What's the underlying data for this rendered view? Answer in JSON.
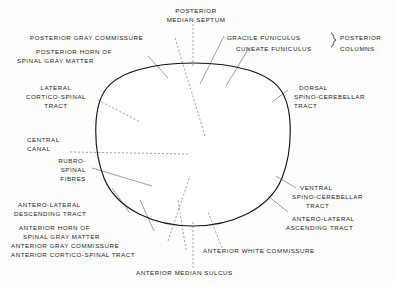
{
  "figure": {
    "background_color": "#fdfdfd",
    "ink_color": "#141414",
    "gray_matter_color": "#9e9e9e",
    "white_matter_color": "#ffffff"
  },
  "labels": {
    "posterior_median_septum": {
      "line1": "POSTERIOR",
      "line2": "MEDIAN SEPTUM"
    },
    "posterior_gray_commissure": {
      "line1": "POSTERIOR GRAY COMMISSURE"
    },
    "posterior_horn": {
      "line1": "POSTERIOR HORN OF",
      "line2": "SPINAL GRAY MATTER"
    },
    "lateral_cortico_spinal": {
      "line1": "LATERAL",
      "line2": "CORTICO-SPINAL",
      "line3": "TRACT"
    },
    "central_canal": {
      "line1": "CENTRAL",
      "line2": "CANAL"
    },
    "rubro_spinal": {
      "line1": "RUBRO-",
      "line2": "SPINAL",
      "line3": "FIBRES"
    },
    "antero_lateral_descending": {
      "line1": "ANTERO-LATERAL",
      "line2": "DESCENDING TRACT"
    },
    "anterior_horn": {
      "line1": "ANTERIOR HORN OF",
      "line2": "SPINAL GRAY MATTER"
    },
    "anterior_gray_commissure": {
      "line1": "ANTERIOR GRAY COMMISSURE"
    },
    "anterior_cortico_spinal": {
      "line1": "ANTERIOR CORTICO-SPINAL TRACT"
    },
    "anterior_median_sulcus": {
      "line1": "ANTERIOR MEDIAN SULCUS"
    },
    "anterior_white_commissure": {
      "line1": "ANTERIOR WHITE COMMISSURE"
    },
    "gracile_funiculus": {
      "line1": "GRACILE FUNICULUS"
    },
    "cuneate_funiculus": {
      "line1": "CUNEATE FUNICULUS"
    },
    "posterior_columns": {
      "line1": "POSTERIOR",
      "line2": "COLUMNS"
    },
    "dorsal_spino_cerebellar": {
      "line1": "DORSAL",
      "line2": "SPINO-CEREBELLAR",
      "line3": "TRACT"
    },
    "ventral_spino_cerebellar": {
      "line1": "VENTRAL",
      "line2": "SPINO-CEREBELLAR",
      "line3": "TRACT"
    },
    "antero_lateral_ascending": {
      "line1": "ANTERO-LATERAL",
      "line2": "ASCENDING TRACT"
    }
  },
  "top_cropped_text": "",
  "structures": {
    "gray_matter_name": "spinal gray matter (butterfly)",
    "central_canal_name": "central canal",
    "cord_outline_name": "spinal cord outline"
  }
}
